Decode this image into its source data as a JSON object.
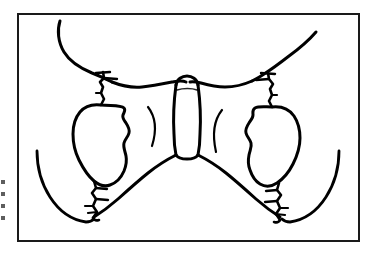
{
  "figure": {
    "title": "Anterior view line drawing of the bony pelvis with fracture lines",
    "kind": "anatomical-line-drawing",
    "subject": "pelvis",
    "view": "anterior",
    "frame": {
      "x": 17,
      "y": 13,
      "width": 343,
      "height": 229,
      "stroke_color": "#1a1a1a",
      "stroke_width": 2,
      "fill_color": "#ffffff"
    },
    "style": {
      "line_color": "#000000",
      "background_color": "#ffffff",
      "thick_stroke": 3.2,
      "medium_stroke": 2.6,
      "thin_stroke": 2.0,
      "tick_stroke": 2.4
    },
    "parts": [
      {
        "name": "left-iliac-crest",
        "label": "Left iliac crest"
      },
      {
        "name": "right-iliac-crest",
        "label": "Right iliac crest"
      },
      {
        "name": "sacrum-body",
        "label": "Sacrum"
      },
      {
        "name": "left-obturator-foramen",
        "label": "Left obturator foramen"
      },
      {
        "name": "right-obturator-foramen",
        "label": "Right obturator foramen"
      },
      {
        "name": "left-superior-fracture",
        "label": "Left superior ramus fracture"
      },
      {
        "name": "right-superior-fracture",
        "label": "Right superior ramus fracture"
      },
      {
        "name": "left-inferior-fracture",
        "label": "Left inferior ramus fracture"
      },
      {
        "name": "right-inferior-fracture",
        "label": "Right inferior ramus fracture"
      },
      {
        "name": "left-sacral-foramen-arc",
        "label": "Left sacral foramen arc"
      },
      {
        "name": "right-sacral-foramen-arc",
        "label": "Right sacral foramen arc"
      }
    ],
    "edge_artifacts": [
      {
        "name": "edge-mark-1",
        "top": 180
      },
      {
        "name": "edge-mark-2",
        "top": 192
      },
      {
        "name": "edge-mark-3",
        "top": 204
      },
      {
        "name": "edge-mark-4",
        "top": 216
      }
    ]
  }
}
